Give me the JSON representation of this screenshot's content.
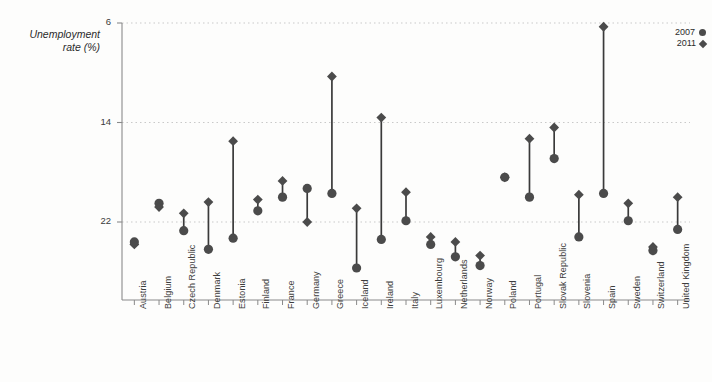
{
  "top_caption": "",
  "axis": {
    "y_title_line1": "Unemployment",
    "y_title_line2": "rate (%)",
    "y_ticks": [
      "22",
      "14",
      "6"
    ]
  },
  "legend": {
    "items": [
      {
        "label": "2007",
        "marker": "circle-marker"
      },
      {
        "label": "2011",
        "marker": "diamond-marker"
      }
    ]
  },
  "chart_data": {
    "type": "scatter",
    "title": "",
    "subtitle": "",
    "xlabel": "",
    "ylabel": "Unemployment rate (%)",
    "ylim": [
      1.2,
      22
    ],
    "y_ticks": [
      6,
      14,
      22
    ],
    "grid": "horizontal-dotted",
    "legend_position": "top-right",
    "connector": "vertical-line-between-series",
    "categories": [
      "Austria",
      "Belgium",
      "Czech Republic",
      "Denmark",
      "Estonia",
      "Finland",
      "France",
      "Germany",
      "Greece",
      "Iceland",
      "Ireland",
      "Italy",
      "Luxembourg",
      "Netherlands",
      "Norway",
      "Poland",
      "Portugal",
      "Slovak Republic",
      "Slovenia",
      "Spain",
      "Sweden",
      "Switzerland",
      "United Kingdom"
    ],
    "series": [
      {
        "name": "2007",
        "marker": "circle",
        "values": [
          4.4,
          7.5,
          5.3,
          3.8,
          4.7,
          6.9,
          8.0,
          8.7,
          8.3,
          2.3,
          4.6,
          6.1,
          4.2,
          3.2,
          2.5,
          9.6,
          8.0,
          11.1,
          4.8,
          8.3,
          6.1,
          3.7,
          5.4
        ]
      },
      {
        "name": "2011",
        "marker": "diamond",
        "values": [
          4.2,
          7.2,
          6.7,
          7.6,
          12.5,
          7.8,
          9.3,
          6.0,
          17.7,
          7.1,
          14.4,
          8.4,
          4.8,
          4.4,
          3.3,
          9.6,
          12.7,
          13.6,
          8.2,
          21.7,
          7.5,
          4.0,
          8.0
        ]
      }
    ]
  },
  "colors": {
    "marker": "#4b4b4b",
    "connector": "#3a3a3a",
    "axis": "#8a8a8a",
    "grid": "#c9c9c9",
    "text": "#2b2b2b",
    "background": "#fdfdfc"
  }
}
